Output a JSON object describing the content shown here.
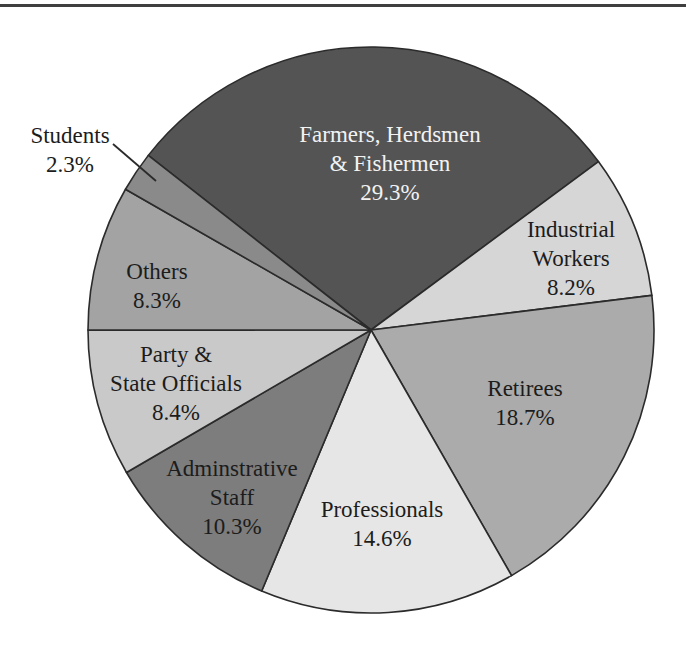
{
  "page": {
    "background": "#ffffff",
    "top_rule_color": "#3f3f3f"
  },
  "chart_data": {
    "type": "pie",
    "title": "",
    "unit": "%",
    "total": 100.1,
    "start_angle_deg": -51.9,
    "stroke_color": "#2b2b2b",
    "stroke_width": 1.6,
    "default_text_color": "#1c1c1c",
    "geometry": {
      "cx": 371,
      "cy": 330,
      "r": 283,
      "font_size": 23,
      "line_height": 29
    },
    "slices": [
      {
        "key": "farmers-herdsmen-fishermen",
        "label": "Farmers, Herdsmen & Fishermen",
        "value": 29.3,
        "display_value": "29.3%",
        "color": "#545454",
        "label_color": "#f2f2f2",
        "lines": [
          "Farmers, Herdsmen",
          "& Fishermen",
          "29.3%"
        ],
        "label_x": 390,
        "label_y": 142,
        "inside": true
      },
      {
        "key": "industrial-workers",
        "label": "Industrial Workers",
        "value": 8.2,
        "display_value": "8.2%",
        "color": "#d6d6d6",
        "label_color": "#1c1c1c",
        "lines": [
          "Industrial",
          "Workers",
          "8.2%"
        ],
        "label_x": 571,
        "label_y": 237,
        "inside": true
      },
      {
        "key": "retirees",
        "label": "Retirees",
        "value": 18.7,
        "display_value": "18.7%",
        "color": "#ababab",
        "label_color": "#1c1c1c",
        "lines": [
          "Retirees",
          "18.7%"
        ],
        "label_x": 525,
        "label_y": 396,
        "inside": true
      },
      {
        "key": "professionals",
        "label": "Professionals",
        "value": 14.6,
        "display_value": "14.6%",
        "color": "#e6e6e6",
        "label_color": "#1c1c1c",
        "lines": [
          "Professionals",
          "14.6%"
        ],
        "label_x": 382,
        "label_y": 517,
        "inside": true
      },
      {
        "key": "adminstrative-staff",
        "label": "Adminstrative Staff",
        "value": 10.3,
        "display_value": "10.3%",
        "color": "#7d7d7d",
        "label_color": "#1c1c1c",
        "lines": [
          "Adminstrative",
          "Staff",
          "10.3%"
        ],
        "label_x": 232,
        "label_y": 476,
        "inside": true
      },
      {
        "key": "party-state-officials",
        "label": "Party & State Officials",
        "value": 8.4,
        "display_value": "8.4%",
        "color": "#c9c9c9",
        "label_color": "#1c1c1c",
        "lines": [
          "Party &",
          "State Officials",
          "8.4%"
        ],
        "label_x": 176,
        "label_y": 362,
        "inside": true
      },
      {
        "key": "others",
        "label": "Others",
        "value": 8.3,
        "display_value": "8.3%",
        "color": "#a3a3a3",
        "label_color": "#1c1c1c",
        "lines": [
          "Others",
          "8.3%"
        ],
        "label_x": 157,
        "label_y": 279,
        "inside": true
      },
      {
        "key": "students",
        "label": "Students",
        "value": 2.3,
        "display_value": "2.3%",
        "color": "#8a8a8a",
        "label_color": "#1c1c1c",
        "lines": [
          "Students",
          "2.3%"
        ],
        "label_x": 70,
        "label_y": 143,
        "inside": false,
        "leader": {
          "x1": 113,
          "y1": 144,
          "x2": 156,
          "y2": 181
        }
      }
    ]
  }
}
